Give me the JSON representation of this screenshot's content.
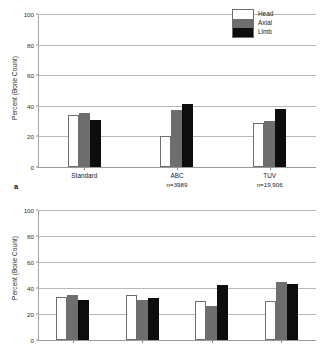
{
  "figure": {
    "background": "#ffffff",
    "panel_letter_a": "a"
  },
  "colors": {
    "head": "#ffffff",
    "axial": "#6e6e6e",
    "limb": "#0d0d0d",
    "grid": "#b8b8b8",
    "axis": "#9a9a9a",
    "text": "#1a1a1a"
  },
  "legend": {
    "items": [
      {
        "label": "Head",
        "color": "#ffffff"
      },
      {
        "label": "Axial",
        "color": "#6e6e6e"
      },
      {
        "label": "Limb",
        "color": "#0d0d0d"
      }
    ]
  },
  "chart_data": [
    {
      "type": "bar",
      "panel": "a",
      "title": "",
      "xlabel": "",
      "ylabel": "Percent (Bone Count)",
      "ylim": [
        0,
        100
      ],
      "yticks": [
        0,
        20,
        40,
        60,
        80,
        100
      ],
      "ytick_labels": [
        "0",
        "20",
        "40",
        "60",
        "80",
        "100"
      ],
      "grid": true,
      "legend_position": "top-right",
      "categories": [
        "Standard",
        "ABC",
        "TUV"
      ],
      "category_sublabels": [
        "",
        "n=3989",
        "n=19,906"
      ],
      "series": [
        {
          "name": "Head",
          "values": [
            34,
            20,
            29
          ]
        },
        {
          "name": "Axial",
          "values": [
            35,
            37.5,
            30
          ]
        },
        {
          "name": "Limb",
          "values": [
            31,
            41.5,
            38
          ]
        }
      ]
    },
    {
      "type": "bar",
      "panel": "b",
      "title": "",
      "xlabel": "",
      "ylabel": "Percent (Bone Count)",
      "ylim": [
        0,
        100
      ],
      "yticks": [
        0,
        20,
        40,
        60,
        80,
        100
      ],
      "ytick_labels": [
        "0",
        "20",
        "40",
        "60",
        "80",
        "100"
      ],
      "grid": true,
      "legend_position": "none",
      "categories": [
        "",
        "",
        "",
        ""
      ],
      "category_sublabels": [
        "",
        "",
        "",
        ""
      ],
      "series": [
        {
          "name": "Head",
          "values": [
            33,
            35,
            30,
            30
          ]
        },
        {
          "name": "Axial",
          "values": [
            34.5,
            30.5,
            26,
            44.5
          ]
        },
        {
          "name": "Limb",
          "values": [
            30.5,
            32,
            42,
            43
          ]
        }
      ]
    }
  ]
}
